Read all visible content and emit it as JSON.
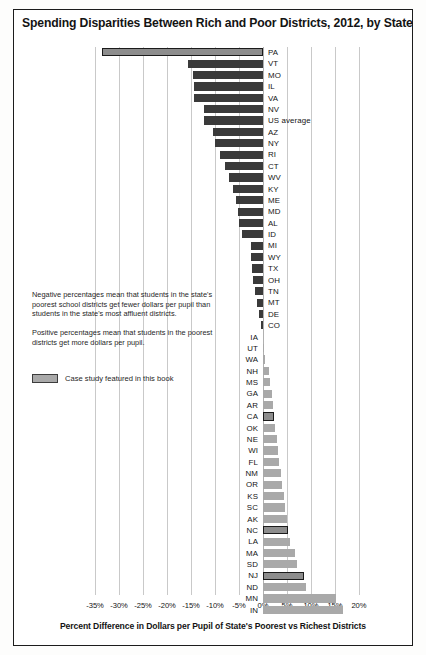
{
  "chart_data": {
    "type": "bar",
    "title": "Spending Disparities Between Rich and Poor Districts, 2012, by State",
    "xlabel": "Percent Difference in Dollars per Pupil of State's Poorest vs Richest Districts",
    "ylabel": "",
    "orientation": "horizontal",
    "xlim": [
      -37.5,
      21.5
    ],
    "xticks": [
      "-35%",
      "-30%",
      "-25%",
      "-20%",
      "-15%",
      "-10%",
      "-5%",
      "0%",
      "5%",
      "10%",
      "15%",
      "20%"
    ],
    "xtick_values": [
      -35,
      -30,
      -25,
      -20,
      -15,
      -10,
      -5,
      0,
      5,
      10,
      15,
      20
    ],
    "grid": true,
    "legend": {
      "position": "inside-left",
      "entries": [
        {
          "label": "Case study featured in this book",
          "color": "#a9a9a9"
        }
      ]
    },
    "annotations": [
      "Negative percentages mean that students in the state's poorest school districts get fewer dollars per pupil than students in the state's most affluent districts.",
      "Positive percentages mean that students in the poorest districts get more dollars per pupil."
    ],
    "categories": [
      "PA",
      "VT",
      "MO",
      "IL",
      "VA",
      "NV",
      "US average",
      "AZ",
      "NY",
      "RI",
      "CT",
      "WV",
      "KY",
      "ME",
      "MD",
      "AL",
      "ID",
      "MI",
      "WY",
      "TX",
      "OH",
      "TN",
      "MT",
      "DE",
      "CO",
      "IA",
      "UT",
      "WA",
      "NH",
      "MS",
      "GA",
      "AR",
      "CA",
      "OK",
      "NE",
      "WI",
      "FL",
      "NM",
      "OR",
      "KS",
      "SC",
      "AK",
      "NC",
      "LA",
      "MA",
      "SD",
      "NJ",
      "ND",
      "MN",
      "IN"
    ],
    "values": [
      -33.5,
      -15.6,
      -14.6,
      -14.4,
      -14.3,
      -12.3,
      -12.2,
      -10.5,
      -10.0,
      -9.0,
      -8.0,
      -7.0,
      -6.3,
      -5.7,
      -5.3,
      -5.0,
      -4.3,
      -2.6,
      -2.4,
      -2.2,
      -2.0,
      -1.6,
      -1.2,
      -0.9,
      -0.5,
      0.0,
      0.1,
      0.4,
      1.2,
      1.5,
      1.8,
      2.1,
      2.3,
      2.6,
      2.9,
      3.1,
      3.4,
      3.7,
      4.0,
      4.3,
      4.6,
      5.0,
      5.3,
      5.7,
      6.6,
      7.0,
      8.5,
      8.9,
      15.3,
      16.6
    ],
    "highlighted": [
      "PA",
      "CA",
      "NC",
      "NJ"
    ],
    "label_side": [
      "right",
      "right",
      "right",
      "right",
      "right",
      "right",
      "right",
      "right",
      "right",
      "right",
      "right",
      "right",
      "right",
      "right",
      "right",
      "right",
      "right",
      "right",
      "right",
      "right",
      "right",
      "right",
      "right",
      "right",
      "right",
      "left",
      "left",
      "left",
      "left",
      "left",
      "left",
      "left",
      "left",
      "left",
      "left",
      "left",
      "left",
      "left",
      "left",
      "left",
      "left",
      "left",
      "left",
      "left",
      "left",
      "left",
      "left",
      "left",
      "left",
      "left"
    ]
  }
}
